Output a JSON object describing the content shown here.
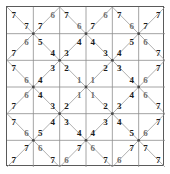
{
  "diagram": {
    "grid": {
      "rows": 6,
      "cols": 6,
      "cell_px": 26.3
    },
    "colors": {
      "background": "#ffffff",
      "frame_border": "#5a5a5a",
      "cell_line": "#8d8d8d",
      "diagonal_line": "#9a9a9a",
      "node_dot": "#4a4a4a",
      "digit_dark": "#1b1b1b",
      "digit_soft": "#6f6f6f"
    },
    "legend": {
      "description": "Each square cell is crossed by diagonals forming triangles; a digit sits in triangles, forming concentric rings from 7 at the border to 1 at the centre."
    }
  },
  "chart_data": {
    "type": "table",
    "rows": 6,
    "cols": 6,
    "cells": [
      [
        {
          "r": 1,
          "c": 1,
          "top": "7",
          "bottom": "7",
          "tone": [
            "dark",
            "dark"
          ]
        },
        {
          "r": 1,
          "c": 2,
          "top": "6",
          "bottom": "7",
          "tone": [
            "soft",
            "dark"
          ]
        },
        {
          "r": 1,
          "c": 3,
          "top": "7",
          "bottom": "6",
          "tone": [
            "dark",
            "soft"
          ]
        },
        {
          "r": 1,
          "c": 4,
          "top": "6",
          "bottom": "7",
          "tone": [
            "soft",
            "dark"
          ]
        },
        {
          "r": 1,
          "c": 5,
          "top": "7",
          "bottom": "6",
          "tone": [
            "dark",
            "soft"
          ]
        },
        {
          "r": 1,
          "c": 6,
          "top": "7",
          "bottom": "7",
          "tone": [
            "dark",
            "dark"
          ]
        }
      ],
      [
        {
          "r": 2,
          "c": 1,
          "top": "6",
          "bottom": "7",
          "tone": [
            "soft",
            "dark"
          ]
        },
        {
          "r": 2,
          "c": 2,
          "top": "5",
          "bottom": "4",
          "tone": [
            "dark",
            "dark"
          ]
        },
        {
          "r": 2,
          "c": 3,
          "top": "4",
          "bottom": "3",
          "tone": [
            "dark",
            "dark"
          ]
        },
        {
          "r": 2,
          "c": 4,
          "top": "4",
          "bottom": "3",
          "tone": [
            "dark",
            "dark"
          ]
        },
        {
          "r": 2,
          "c": 5,
          "top": "5",
          "bottom": "4",
          "tone": [
            "dark",
            "dark"
          ]
        },
        {
          "r": 2,
          "c": 6,
          "top": "6",
          "bottom": "7",
          "tone": [
            "soft",
            "dark"
          ]
        }
      ],
      [
        {
          "r": 3,
          "c": 1,
          "top": "7",
          "bottom": "6",
          "tone": [
            "dark",
            "soft"
          ]
        },
        {
          "r": 3,
          "c": 2,
          "top": "3",
          "bottom": "4",
          "tone": [
            "dark",
            "dark"
          ]
        },
        {
          "r": 3,
          "c": 3,
          "top": "2",
          "bottom": "1",
          "tone": [
            "dark",
            "soft"
          ]
        },
        {
          "r": 3,
          "c": 4,
          "top": "2",
          "bottom": "1",
          "tone": [
            "dark",
            "soft"
          ]
        },
        {
          "r": 3,
          "c": 5,
          "top": "3",
          "bottom": "4",
          "tone": [
            "dark",
            "dark"
          ]
        },
        {
          "r": 3,
          "c": 6,
          "top": "7",
          "bottom": "6",
          "tone": [
            "dark",
            "soft"
          ]
        }
      ],
      [
        {
          "r": 4,
          "c": 1,
          "top": "6",
          "bottom": "7",
          "tone": [
            "soft",
            "dark"
          ]
        },
        {
          "r": 4,
          "c": 2,
          "top": "4",
          "bottom": "3",
          "tone": [
            "dark",
            "dark"
          ]
        },
        {
          "r": 4,
          "c": 3,
          "top": "1",
          "bottom": "2",
          "tone": [
            "soft",
            "dark"
          ]
        },
        {
          "r": 4,
          "c": 4,
          "top": "1",
          "bottom": "2",
          "tone": [
            "soft",
            "dark"
          ]
        },
        {
          "r": 4,
          "c": 5,
          "top": "4",
          "bottom": "3",
          "tone": [
            "dark",
            "dark"
          ]
        },
        {
          "r": 4,
          "c": 6,
          "top": "6",
          "bottom": "7",
          "tone": [
            "soft",
            "dark"
          ]
        }
      ],
      [
        {
          "r": 5,
          "c": 1,
          "top": "7",
          "bottom": "6",
          "tone": [
            "dark",
            "soft"
          ]
        },
        {
          "r": 5,
          "c": 2,
          "top": "4",
          "bottom": "5",
          "tone": [
            "dark",
            "dark"
          ]
        },
        {
          "r": 5,
          "c": 3,
          "top": "3",
          "bottom": "4",
          "tone": [
            "dark",
            "dark"
          ]
        },
        {
          "r": 5,
          "c": 4,
          "top": "3",
          "bottom": "4",
          "tone": [
            "dark",
            "dark"
          ]
        },
        {
          "r": 5,
          "c": 5,
          "top": "4",
          "bottom": "5",
          "tone": [
            "dark",
            "dark"
          ]
        },
        {
          "r": 5,
          "c": 6,
          "top": "7",
          "bottom": "6",
          "tone": [
            "dark",
            "soft"
          ]
        }
      ],
      [
        {
          "r": 6,
          "c": 1,
          "top": "7",
          "bottom": "7",
          "tone": [
            "dark",
            "dark"
          ]
        },
        {
          "r": 6,
          "c": 2,
          "top": "6",
          "bottom": "7",
          "tone": [
            "soft",
            "dark"
          ]
        },
        {
          "r": 6,
          "c": 3,
          "top": "7",
          "bottom": "6",
          "tone": [
            "dark",
            "soft"
          ]
        },
        {
          "r": 6,
          "c": 4,
          "top": "6",
          "bottom": "7",
          "tone": [
            "soft",
            "dark"
          ]
        },
        {
          "r": 6,
          "c": 5,
          "top": "7",
          "bottom": "6",
          "tone": [
            "dark",
            "soft"
          ]
        },
        {
          "r": 6,
          "c": 6,
          "top": "7",
          "bottom": "7",
          "tone": [
            "dark",
            "dark"
          ]
        }
      ]
    ]
  }
}
